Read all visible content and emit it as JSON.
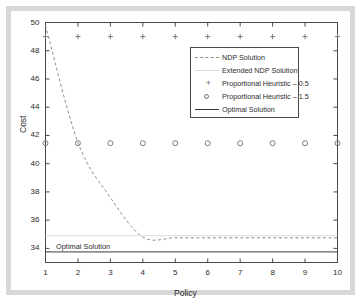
{
  "figure": {
    "background_color": "#ffffff",
    "frame_color": "#d8d8d8",
    "axis_color": "#4a4a4a"
  },
  "chart_data": {
    "type": "line",
    "title": "",
    "xlabel": "Policy",
    "ylabel": "Cost",
    "xlim": [
      1,
      10
    ],
    "ylim": [
      33,
      50
    ],
    "xticks": [
      "1",
      "2",
      "3",
      "4",
      "5",
      "6",
      "7",
      "8",
      "9",
      "10"
    ],
    "yticks": [
      "34",
      "36",
      "38",
      "40",
      "42",
      "44",
      "46",
      "48",
      "50"
    ],
    "grid": false,
    "legend_position": "upper right",
    "annotations": [
      {
        "text": "Optimal Solution",
        "x": 1.35,
        "y": 34.0
      }
    ],
    "x": [
      1,
      2,
      3,
      4,
      5,
      6,
      7,
      8,
      9,
      10
    ],
    "series": [
      {
        "name": "NDP Solution",
        "style": "dashed",
        "color": "#8c8c8c",
        "values": [
          49.8,
          41.5,
          37.6,
          34.8,
          34.75,
          34.75,
          34.75,
          34.75,
          34.75,
          34.75
        ]
      },
      {
        "name": "Extended NDP Solution",
        "style": "solid-faint",
        "color": "#dcdcdc",
        "values": [
          34.9,
          34.9,
          34.9,
          34.9,
          34.9,
          34.9,
          34.9,
          34.9,
          34.9,
          34.9
        ]
      },
      {
        "name": "Proportional Heuristic – 0.5",
        "style": "marker-plus",
        "color": "#6e6e6e",
        "values": [
          49.0,
          49.0,
          49.0,
          49.0,
          49.0,
          49.0,
          49.0,
          49.0,
          49.0,
          49.0
        ]
      },
      {
        "name": "Proportional Heuristic – 1.5",
        "style": "marker-circle",
        "color": "#6e6e6e",
        "values": [
          41.45,
          41.45,
          41.45,
          41.45,
          41.45,
          41.45,
          41.45,
          41.45,
          41.45,
          41.45
        ]
      },
      {
        "name": "Optimal Solution",
        "style": "solid",
        "color": "#3a3a3a",
        "values": [
          33.75,
          33.75,
          33.75,
          33.75,
          33.75,
          33.75,
          33.75,
          33.75,
          33.75,
          33.75
        ]
      }
    ],
    "legend": [
      {
        "label": "NDP Solution",
        "key": "dashed-line-key"
      },
      {
        "label": "Extended NDP Solution",
        "key": "faint-line-key"
      },
      {
        "label": "Proportional Heuristic – 0.5",
        "key": "plus-marker-key"
      },
      {
        "label": "Proportional Heuristic – 1.5",
        "key": "circle-marker-key"
      },
      {
        "label": "Optimal Solution",
        "key": "solid-line-key"
      }
    ]
  }
}
